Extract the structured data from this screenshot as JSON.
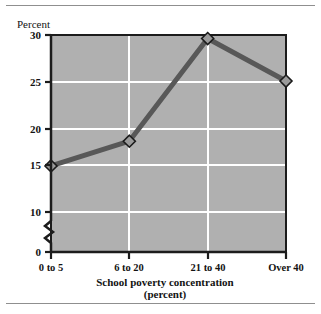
{
  "figure": {
    "name": "school-poverty-concentration-line-chart",
    "background_color": "#ffffff",
    "rule_color": "#8f8f8f"
  },
  "chart_data": {
    "type": "line",
    "title": "",
    "ylabel": "Percent",
    "xlabel": "School poverty concentration",
    "xlabel_sub": "(percent)",
    "categories": [
      "0 to 5",
      "6 to 20",
      "21 to 40",
      "Over 40"
    ],
    "values": [
      15.2,
      18.0,
      29.6,
      24.8
    ],
    "series": [
      {
        "name": "Percent",
        "values": [
          15.2,
          18.0,
          29.6,
          24.8
        ]
      }
    ],
    "ylim": [
      0,
      30
    ],
    "y_ticks": [
      "0",
      "10",
      "15",
      "20",
      "25",
      "30"
    ],
    "y_tick_values": [
      0,
      10,
      15,
      20,
      25,
      30
    ],
    "y_axis_break": true,
    "y_axis_break_between": [
      0,
      10
    ],
    "gridlines": {
      "horizontal": [
        10,
        15,
        20,
        25
      ],
      "vertical_categories": [
        "6 to 20",
        "21 to 40"
      ],
      "color": "#ffffff"
    },
    "plot_background_color": "#b0b0b0",
    "line_color": "#585858",
    "marker_shape": "diamond",
    "marker_fill": "#9a9a9a",
    "marker_edge": "#1a1a1a",
    "legend": null,
    "legend_position": "none"
  },
  "axis": {
    "y_title": "Percent",
    "y_ticks": [
      {
        "label": "30",
        "value": 30
      },
      {
        "label": "25",
        "value": 25
      },
      {
        "label": "20",
        "value": 20
      },
      {
        "label": "15",
        "value": 15
      },
      {
        "label": "10",
        "value": 10
      },
      {
        "label": "0",
        "value": 0
      }
    ],
    "x_ticks": [
      {
        "label": "0 to 5"
      },
      {
        "label": "6 to 20"
      },
      {
        "label": "21 to 40"
      },
      {
        "label": "Over 40"
      }
    ],
    "x_title_line1": "School poverty concentration",
    "x_title_line2": "(percent)"
  }
}
